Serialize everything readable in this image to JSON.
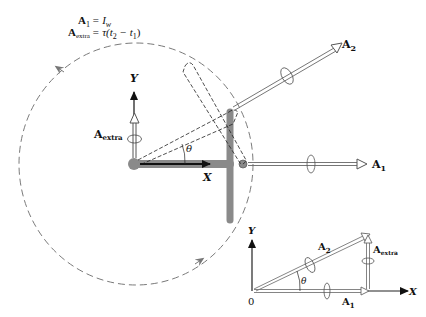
{
  "equations": {
    "line1": "A₁ = I_w",
    "line1_lhs": "A",
    "line1_lhs_sub": "1",
    "line1_rhs": "= I",
    "line1_rhs_sub": "w",
    "line2_lhs": "A",
    "line2_lhs_sub": "extra",
    "line2_rhs": "= τ(t",
    "line2_rhs_sub1": "2",
    "line2_mid": " − t",
    "line2_rhs_sub2": "1",
    "line2_end": ")"
  },
  "main_view": {
    "axis_x_label": "X",
    "axis_y_label": "Y",
    "angle_label": "θ",
    "vector_a1_label": "A",
    "vector_a1_sub": "1",
    "vector_a2_label": "A",
    "vector_a2_sub": "2",
    "vector_extra_label": "A",
    "vector_extra_sub": "extra",
    "orbit_circle_style": "dashed",
    "colors": {
      "rod": "#8a8a8a",
      "orbit": "#7a7a7a",
      "ink": "#111111"
    }
  },
  "inset_view": {
    "origin_label": "0",
    "axis_x_label": "X",
    "axis_y_label": "Y",
    "angle_label": "θ",
    "vector_a1_label": "A",
    "vector_a1_sub": "1",
    "vector_a2_label": "A",
    "vector_a2_sub": "2",
    "vector_extra_label": "A",
    "vector_extra_sub": "extra"
  }
}
